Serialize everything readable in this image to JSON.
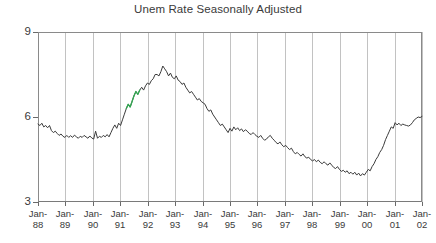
{
  "chart_data": {
    "type": "line",
    "title": "Unem Rate Seasonally Adjusted",
    "xlabel": "",
    "ylabel": "",
    "ylim": [
      3,
      9
    ],
    "yticks": [
      3,
      6,
      9
    ],
    "ytick_labels": [
      "3",
      "6",
      "9"
    ],
    "grid": "vertical",
    "legend": "none",
    "xtick_labels": [
      {
        "line1": "Jan-",
        "line2": "88"
      },
      {
        "line1": "Jan-",
        "line2": "89"
      },
      {
        "line1": "Jan-",
        "line2": "90"
      },
      {
        "line1": "Jan-",
        "line2": "91"
      },
      {
        "line1": "Jan-",
        "line2": "92"
      },
      {
        "line1": "Jan-",
        "line2": "93"
      },
      {
        "line1": "Jan-",
        "line2": "94"
      },
      {
        "line1": "Jan-",
        "line2": "95"
      },
      {
        "line1": "Jan-",
        "line2": "96"
      },
      {
        "line1": "Jan-",
        "line2": "97"
      },
      {
        "line1": "Jan-",
        "line2": "98"
      },
      {
        "line1": "Jan-",
        "line2": "99"
      },
      {
        "line1": "Jan-",
        "line2": "00"
      },
      {
        "line1": "Jan-",
        "line2": "01"
      },
      {
        "line1": "Jan-",
        "line2": "02"
      }
    ],
    "x_start": "Jan-88",
    "x_end": "Jan-02",
    "x_interval": "monthly",
    "line_color": "#3b3b3b",
    "highlight_color": "#32a852",
    "highlight_range": [
      "Nov-91",
      "Mar-92"
    ],
    "series": [
      {
        "name": "Unemployment Rate",
        "values": [
          5.75,
          5.7,
          5.78,
          5.65,
          5.7,
          5.62,
          5.7,
          5.52,
          5.45,
          5.5,
          5.42,
          5.35,
          5.4,
          5.32,
          5.28,
          5.35,
          5.28,
          5.34,
          5.28,
          5.36,
          5.3,
          5.25,
          5.32,
          5.28,
          5.35,
          5.3,
          5.25,
          5.33,
          5.26,
          5.22,
          5.5,
          5.25,
          5.32,
          5.28,
          5.35,
          5.3,
          5.38,
          5.3,
          5.45,
          5.6,
          5.72,
          5.6,
          5.78,
          5.7,
          5.9,
          6.1,
          6.3,
          6.45,
          6.35,
          6.55,
          6.75,
          6.9,
          6.8,
          6.95,
          7.05,
          6.95,
          7.1,
          7.2,
          7.15,
          7.28,
          7.35,
          7.5,
          7.5,
          7.45,
          7.6,
          7.8,
          7.7,
          7.6,
          7.45,
          7.55,
          7.4,
          7.35,
          7.45,
          7.3,
          7.25,
          7.15,
          7.2,
          7.05,
          6.95,
          6.85,
          6.9,
          6.8,
          6.7,
          6.6,
          6.65,
          6.55,
          6.5,
          6.45,
          6.3,
          6.2,
          6.25,
          6.1,
          6.0,
          5.9,
          5.8,
          5.7,
          5.75,
          5.65,
          5.55,
          5.45,
          5.6,
          5.5,
          5.65,
          5.55,
          5.62,
          5.52,
          5.58,
          5.48,
          5.55,
          5.5,
          5.42,
          5.38,
          5.45,
          5.38,
          5.32,
          5.28,
          5.35,
          5.25,
          5.18,
          5.22,
          5.3,
          5.35,
          5.25,
          5.18,
          5.1,
          5.05,
          5.12,
          5.02,
          4.95,
          5.0,
          4.92,
          4.85,
          4.9,
          4.78,
          4.7,
          4.75,
          4.68,
          4.62,
          4.7,
          4.6,
          4.55,
          4.58,
          4.5,
          4.45,
          4.5,
          4.42,
          4.48,
          4.4,
          4.35,
          4.42,
          4.35,
          4.3,
          4.38,
          4.3,
          4.22,
          4.18,
          4.25,
          4.15,
          4.08,
          4.12,
          4.05,
          4.1,
          4.0,
          4.05,
          3.98,
          4.05,
          3.95,
          4.02,
          3.92,
          4.0,
          3.95,
          4.05,
          4.15,
          4.1,
          4.25,
          4.35,
          4.5,
          4.6,
          4.75,
          4.85,
          5.0,
          5.2,
          5.35,
          5.5,
          5.65,
          5.6,
          5.8,
          5.72,
          5.78,
          5.7,
          5.75,
          5.72,
          5.7,
          5.68,
          5.72,
          5.8,
          5.9,
          5.95,
          6.0,
          5.98,
          6.02
        ]
      }
    ]
  }
}
